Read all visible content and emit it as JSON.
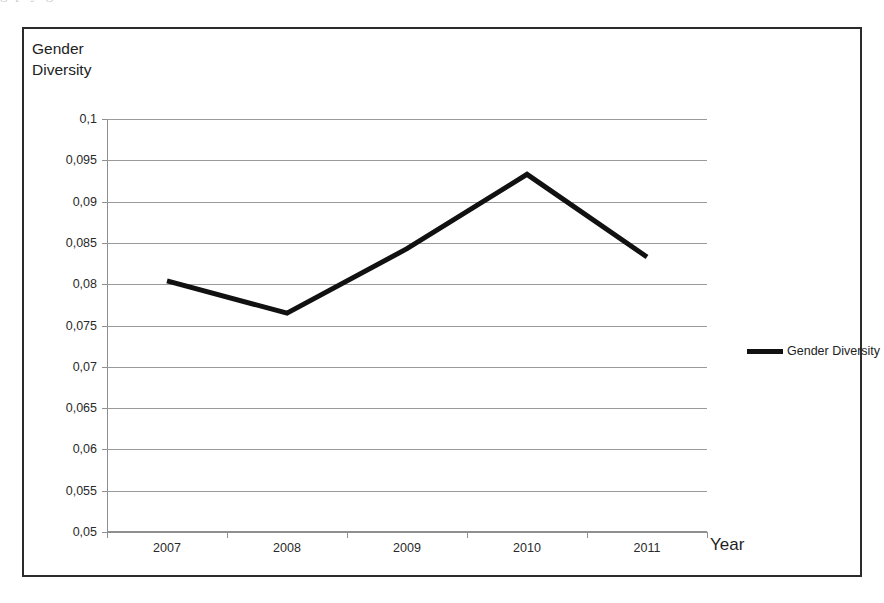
{
  "scan": {
    "top_fragment": "g      p      y          g"
  },
  "chart_title": "Gender\nDiversity",
  "legend": {
    "position": "right",
    "entries": [
      {
        "label": "Gender Diversity",
        "color": "#111111"
      }
    ]
  },
  "axis": {
    "x_title": "Year",
    "y_title": "Gender Diversity"
  },
  "chart_data": {
    "type": "line",
    "title": "Gender Diversity",
    "xlabel": "Year",
    "ylabel": "Gender Diversity",
    "categories": [
      "2007",
      "2008",
      "2009",
      "2010",
      "2011"
    ],
    "series": [
      {
        "name": "Gender Diversity",
        "color": "#111111",
        "values": [
          0.0804,
          0.0765,
          0.0843,
          0.0933,
          0.0833
        ]
      }
    ],
    "ylim": [
      0.05,
      0.1
    ],
    "ytick_step": 0.005,
    "ytick_labels": [
      "0,05",
      "0,055",
      "0,06",
      "0,065",
      "0,07",
      "0,075",
      "0,08",
      "0,085",
      "0,09",
      "0,095",
      "0,1"
    ],
    "ytick_values": [
      0.05,
      0.055,
      0.06,
      0.065,
      0.07,
      0.075,
      0.08,
      0.085,
      0.09,
      0.095,
      0.1
    ],
    "xtick_labels": [
      "2007",
      "2008",
      "2009",
      "2010",
      "2011"
    ],
    "grid": true,
    "decimal_separator": ",",
    "markers": false,
    "line_width": 5
  }
}
